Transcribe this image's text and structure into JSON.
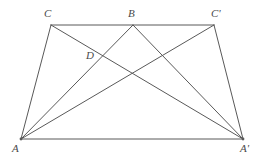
{
  "figure": {
    "type": "geometry-diagram",
    "width": 264,
    "height": 163,
    "background_color": "#ffffff",
    "stroke_color": "#595959",
    "stroke_width": 1,
    "label_color": "#4a4a4a",
    "points": [
      {
        "id": "A",
        "label": "A",
        "x": 21,
        "y": 139,
        "label_x": 12,
        "label_y": 143
      },
      {
        "id": "Ap",
        "label": "A'",
        "x": 243,
        "y": 139,
        "label_x": 240,
        "label_y": 143
      },
      {
        "id": "C",
        "label": "C",
        "x": 51,
        "y": 25,
        "label_x": 44,
        "label_y": 8
      },
      {
        "id": "B",
        "label": "B",
        "x": 133,
        "y": 25,
        "label_x": 128,
        "label_y": 8
      },
      {
        "id": "Cp",
        "label": "C'",
        "x": 214,
        "y": 25,
        "label_x": 211,
        "label_y": 8
      },
      {
        "id": "D",
        "label": "D",
        "x": 100,
        "y": 57,
        "label_x": 86,
        "label_y": 50
      }
    ],
    "segments": [
      {
        "name": "side-A-C",
        "from": "A",
        "to": "C"
      },
      {
        "name": "side-C-Cprime",
        "from": "C",
        "to": "Cp"
      },
      {
        "name": "side-Cprime-Aprime",
        "from": "Cp",
        "to": "Ap"
      },
      {
        "name": "side-A-Aprime",
        "from": "A",
        "to": "Ap"
      },
      {
        "name": "diagonal-A-B",
        "from": "A",
        "to": "B"
      },
      {
        "name": "diagonal-A-Cprime",
        "from": "A",
        "to": "Cp"
      },
      {
        "name": "diagonal-Aprime-B",
        "from": "Ap",
        "to": "B"
      },
      {
        "name": "diagonal-Aprime-C",
        "from": "Ap",
        "to": "C"
      }
    ]
  }
}
